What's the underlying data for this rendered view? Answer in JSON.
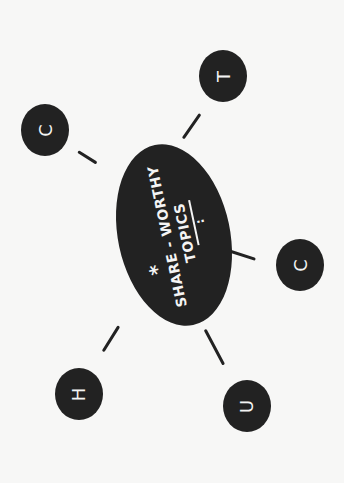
{
  "diagram": {
    "type": "mind-map",
    "orientation": "rotated 90 degrees counter-clockwise",
    "center": {
      "star": "*",
      "line1": "SHARE - WORTHY",
      "line2": "TOPICS",
      "dots": ":"
    },
    "nodes": [
      {
        "id": "top-left",
        "letter": "C"
      },
      {
        "id": "top-right",
        "letter": "T"
      },
      {
        "id": "right",
        "letter": "C"
      },
      {
        "id": "bottom",
        "letter": "U"
      },
      {
        "id": "bottom-left",
        "letter": "H"
      }
    ],
    "colors": {
      "background": "#f7f7f6",
      "fill": "#222222",
      "text": "#f4f4f4"
    }
  }
}
